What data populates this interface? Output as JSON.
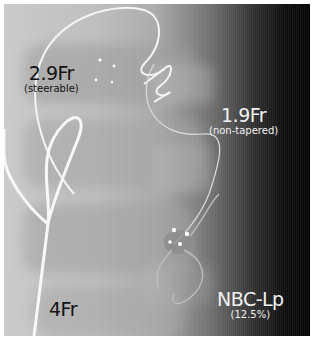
{
  "image": {
    "description": "Fluoroscopic X-ray image showing catheters and microcatheter with embolic agent",
    "background_gradient": [
      "#c9c9c9",
      "#a9a9a9",
      "#2e2e2e",
      "#050505"
    ]
  },
  "labels": [
    {
      "id": "catheter-29fr",
      "main": "2.9Fr",
      "sub": "(steerable)",
      "color": "#111111"
    },
    {
      "id": "catheter-19fr",
      "main": "1.9Fr",
      "sub": "(non-tapered)",
      "color": "#f2f2f2"
    },
    {
      "id": "catheter-4fr",
      "main": "4Fr",
      "sub": "",
      "color": "#111111"
    },
    {
      "id": "embolic-agent",
      "main": "NBC-Lp",
      "sub": "(12.5%)",
      "color": "#f2f2f2"
    }
  ]
}
